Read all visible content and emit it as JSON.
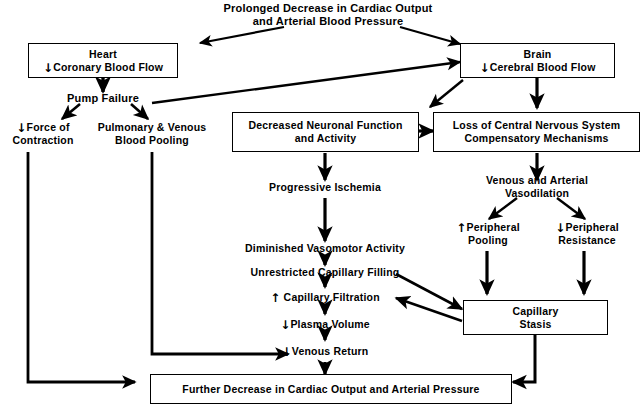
{
  "diagram": {
    "colors": {
      "stroke": "#000000",
      "fill": "#ffffff",
      "text": "#000000"
    },
    "nodes": {
      "trigger": {
        "line1": "Prolonged Decrease in Cardiac Output",
        "line2": "and Arterial Blood Pressure",
        "shape": "text"
      },
      "heart": {
        "line1": "Heart",
        "arrow": "↓",
        "line2": "Coronary Blood Flow",
        "shape": "box"
      },
      "brain": {
        "line1": "Brain",
        "arrow": "↓",
        "line2": "Cerebral Blood Flow",
        "shape": "box"
      },
      "pump_failure": {
        "line1": "Pump Failure",
        "shape": "text"
      },
      "force_contraction": {
        "arrow": "↓",
        "line1": "Force of",
        "line2": "Contraction",
        "shape": "text"
      },
      "blood_pooling": {
        "line1": "Pulmonary & Venous",
        "line2": "Blood Pooling",
        "shape": "text"
      },
      "neuronal": {
        "line1": "Decreased Neuronal Function",
        "line2": "and Activity",
        "shape": "box"
      },
      "cns_loss": {
        "line1": "Loss of Central Nervous System",
        "line2": "Compensatory Mechanisms",
        "shape": "box"
      },
      "ischemia": {
        "line1": "Progressive Ischemia",
        "shape": "text"
      },
      "vasodilation": {
        "line1": "Venous and Arterial",
        "line2": "Vasodilation",
        "shape": "text"
      },
      "vasomotor": {
        "line1": "Diminished Vasomotor Activity",
        "shape": "text"
      },
      "cap_filling": {
        "line1": "Unrestricted Capillary Filling",
        "shape": "text"
      },
      "cap_filtration": {
        "arrow": "↑",
        "line1": "Capillary Filtration",
        "shape": "text"
      },
      "plasma_volume": {
        "arrow": "↓",
        "line1": "Plasma Volume",
        "shape": "text"
      },
      "venous_return": {
        "arrow": "↓",
        "line1": "Venous Return",
        "shape": "text"
      },
      "peripheral_pooling": {
        "arrow": "↑",
        "line1": "Peripheral",
        "line2": "Pooling",
        "shape": "text"
      },
      "peripheral_resistance": {
        "arrow": "↓",
        "line1": "Peripheral",
        "line2": "Resistance",
        "shape": "text"
      },
      "capillary_stasis": {
        "line1": "Capillary",
        "line2": "Stasis",
        "shape": "box"
      },
      "further_decrease": {
        "line1": "Further Decrease in Cardiac Output and Arterial Pressure",
        "shape": "box"
      }
    },
    "edges": [
      {
        "from": "trigger",
        "to": "heart",
        "style": "diagonal-arrow"
      },
      {
        "from": "trigger",
        "to": "brain",
        "style": "diagonal-arrow"
      },
      {
        "from": "heart",
        "to": "pump_failure",
        "style": "straight-arrow"
      },
      {
        "from": "pump_failure",
        "to": "brain",
        "style": "long-diagonal-arrow"
      },
      {
        "from": "pump_failure",
        "to": "force_contraction",
        "style": "diagonal-arrow"
      },
      {
        "from": "pump_failure",
        "to": "blood_pooling",
        "style": "diagonal-arrow"
      },
      {
        "from": "brain",
        "to": "neuronal",
        "style": "diagonal-arrow"
      },
      {
        "from": "brain",
        "to": "cns_loss",
        "style": "straight-arrow"
      },
      {
        "from": "neuronal",
        "to": "cns_loss",
        "style": "straight-arrow"
      },
      {
        "from": "neuronal",
        "to": "ischemia",
        "style": "straight-arrow"
      },
      {
        "from": "cns_loss",
        "to": "vasodilation",
        "style": "straight-arrow"
      },
      {
        "from": "ischemia",
        "to": "vasomotor",
        "style": "straight-arrow"
      },
      {
        "from": "vasomotor",
        "to": "cap_filling",
        "style": "short-arrow"
      },
      {
        "from": "cap_filling",
        "to": "cap_filtration",
        "style": "short-arrow"
      },
      {
        "from": "cap_filtration",
        "to": "plasma_volume",
        "style": "short-arrow"
      },
      {
        "from": "plasma_volume",
        "to": "venous_return",
        "style": "short-arrow"
      },
      {
        "from": "venous_return",
        "to": "further_decrease",
        "style": "short-arrow"
      },
      {
        "from": "vasodilation",
        "to": "peripheral_pooling",
        "style": "diagonal-arrow"
      },
      {
        "from": "vasodilation",
        "to": "peripheral_resistance",
        "style": "diagonal-arrow"
      },
      {
        "from": "peripheral_pooling",
        "to": "capillary_stasis",
        "style": "straight-arrow"
      },
      {
        "from": "peripheral_resistance",
        "to": "capillary_stasis",
        "style": "straight-arrow"
      },
      {
        "from": "cap_filling",
        "to": "capillary_stasis",
        "style": "diagonal-arrow"
      },
      {
        "from": "capillary_stasis",
        "to": "cap_filtration",
        "style": "diagonal-arrow"
      },
      {
        "from": "capillary_stasis",
        "to": "further_decrease",
        "style": "elbow-arrow"
      },
      {
        "from": "force_contraction",
        "to": "further_decrease",
        "style": "elbow-arrow"
      },
      {
        "from": "blood_pooling",
        "to": "venous_return",
        "style": "elbow-arrow"
      }
    ]
  }
}
